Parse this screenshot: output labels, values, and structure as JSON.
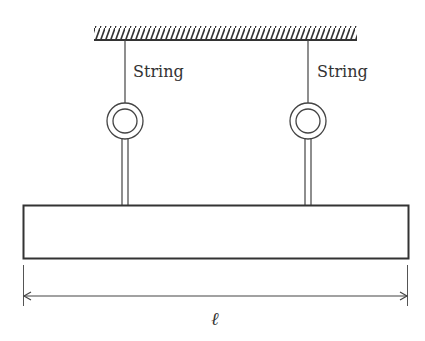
{
  "diagram": {
    "labels": {
      "string_left": "String",
      "string_right": "String",
      "length": "ℓ"
    },
    "colors": {
      "stroke": "#333333",
      "background": "#ffffff"
    },
    "elements": {
      "ceiling": {
        "x1": 94,
        "x2": 357,
        "y": 40,
        "hatch_height": 14
      },
      "strings": [
        {
          "x": 125,
          "top": 40,
          "bottom": 103
        },
        {
          "x": 308,
          "top": 40,
          "bottom": 103
        }
      ],
      "rings": [
        {
          "cx": 125,
          "cy": 121,
          "r_outer": 18,
          "r_inner": 12
        },
        {
          "cx": 308,
          "cy": 121,
          "r_outer": 18,
          "r_inner": 12
        }
      ],
      "bar": {
        "x": 23,
        "y": 205,
        "width": 386,
        "height": 54
      },
      "dimension": {
        "x1": 23,
        "x2": 409,
        "y": 296
      }
    }
  }
}
